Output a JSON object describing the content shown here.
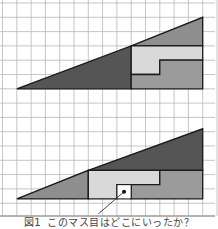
{
  "figure": {
    "caption_number": "図1",
    "caption_text": "このマス目はどこにいったか？",
    "grid": {
      "cell_size_px": 14.3,
      "columns": 15,
      "rows": 15,
      "origin_x": 2.5,
      "origin_y": 3,
      "line_color": "#b8b8b8",
      "bottom_rule_color": "#9a9a9a"
    },
    "colors": {
      "dark_triangle": "#555555",
      "medium_triangle": "#8e8e8e",
      "light_piece": "#d9d9d9",
      "medium_piece": "#9b9b9b",
      "outline": "#1a1a1a",
      "hole": "#ffffff"
    },
    "top_arrangement": {
      "label": "original",
      "outer_triangle": {
        "left_tip": [
          1,
          6
        ],
        "right_top": [
          14,
          1
        ],
        "base_right": [
          14,
          6
        ]
      },
      "pieces": [
        {
          "name": "large-dark-triangle",
          "color_key": "dark_triangle",
          "points": [
            [
              1,
              6
            ],
            [
              9,
              6
            ],
            [
              9,
              3
            ]
          ]
        },
        {
          "name": "small-gray-triangle",
          "color_key": "medium_triangle",
          "points": [
            [
              9,
              3
            ],
            [
              14,
              1
            ],
            [
              14,
              3
            ]
          ]
        },
        {
          "name": "light-l-piece",
          "color_key": "light_piece",
          "points": [
            [
              9,
              3
            ],
            [
              14,
              3
            ],
            [
              14,
              4
            ],
            [
              11,
              4
            ],
            [
              11,
              5
            ],
            [
              9,
              5
            ]
          ]
        },
        {
          "name": "medium-l-piece",
          "color_key": "medium_piece",
          "points": [
            [
              11,
              4
            ],
            [
              14,
              4
            ],
            [
              14,
              6
            ],
            [
              9,
              6
            ],
            [
              9,
              5
            ],
            [
              11,
              5
            ]
          ]
        }
      ]
    },
    "bottom_arrangement": {
      "label": "rearranged",
      "outer_triangle": {
        "left_tip": [
          1,
          13.7
        ],
        "right_top": [
          14,
          8.8
        ],
        "base_right": [
          14,
          13.7
        ]
      },
      "pieces": [
        {
          "name": "small-gray-triangle",
          "color_key": "medium_triangle",
          "points": [
            [
              1,
              13.7
            ],
            [
              6,
              13.7
            ],
            [
              6,
              11.7
            ]
          ]
        },
        {
          "name": "large-dark-triangle",
          "color_key": "dark_triangle",
          "points": [
            [
              6,
              11.7
            ],
            [
              14,
              8.8
            ],
            [
              14,
              11.7
            ]
          ]
        },
        {
          "name": "light-l-piece",
          "color_key": "light_piece",
          "points": [
            [
              6,
              11.7
            ],
            [
              11,
              11.7
            ],
            [
              11,
              12.7
            ],
            [
              8,
              12.7
            ],
            [
              8,
              13.7
            ],
            [
              6,
              13.7
            ]
          ]
        },
        {
          "name": "medium-l-piece",
          "color_key": "medium_piece",
          "points": [
            [
              11,
              11.7
            ],
            [
              14,
              11.7
            ],
            [
              14,
              13.7
            ],
            [
              9,
              13.7
            ],
            [
              9,
              12.7
            ],
            [
              11,
              12.7
            ]
          ]
        }
      ],
      "hole": {
        "x": 8,
        "y": 12.7,
        "w": 1,
        "h": 1
      },
      "pointer": {
        "dot": [
          8.5,
          13.2
        ],
        "end": [
          6.7,
          14.75
        ]
      }
    }
  }
}
